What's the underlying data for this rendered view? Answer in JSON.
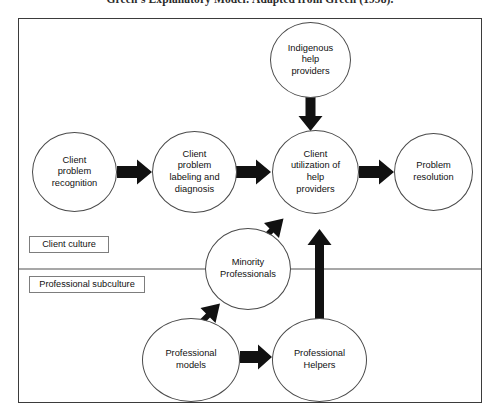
{
  "figure": {
    "caption": "Green’s Explanatory Model: Adapted from Green (1998).",
    "frame_color": "#3b3b3b",
    "node_stroke": "#4a4a4a",
    "arrow_color": "#111111",
    "divider_color": "#8a8a8a",
    "background": "#ffffff"
  },
  "nodes": {
    "indigenous_help_providers": {
      "label": "Indigenous\nhelp\nproviders"
    },
    "client_problem_recognition": {
      "label": "Client\nproblem\nrecognition"
    },
    "client_problem_labeling": {
      "label": "Client\nproblem\nlabeling and\ndiagnosis"
    },
    "client_utilization": {
      "label": "Client\nutilization of\nhelp\nproviders"
    },
    "problem_resolution": {
      "label": "Problem\nresolution"
    },
    "minority_professionals": {
      "label": "Minority\nProfessionals"
    },
    "professional_models": {
      "label": "Professional\nmodels"
    },
    "professional_helpers": {
      "label": "Professional\nHelpers"
    }
  },
  "culture_labels": {
    "client": "Client culture",
    "professional": "Professional subculture"
  }
}
